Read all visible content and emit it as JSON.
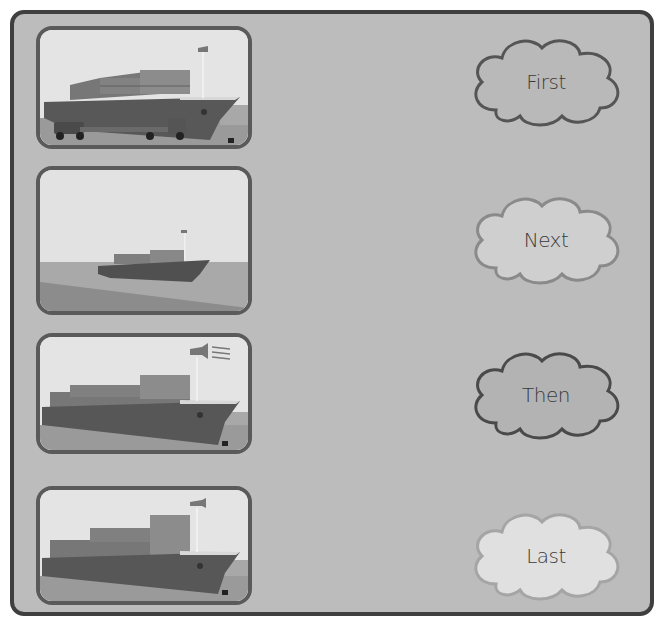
{
  "worksheet": {
    "title": "Sequencing: Cargo Ship",
    "panels": [
      {
        "id": 1,
        "scene": "ship-docked-loading-truck",
        "description": "Container ship docked with truck loading cargo"
      },
      {
        "id": 2,
        "scene": "ship-at-sea-far",
        "description": "Container ship sailing at sea in the distance"
      },
      {
        "id": 3,
        "scene": "ship-horn-sounding",
        "description": "Container ship arriving with horn sounding"
      },
      {
        "id": 4,
        "scene": "ship-docked",
        "description": "Container ship docked at port"
      }
    ],
    "clouds": [
      {
        "label": "First",
        "fill": "#b9b9b9",
        "stroke": "#555555"
      },
      {
        "label": "Next",
        "fill": "#cfcfcf",
        "stroke": "#8a8a8a"
      },
      {
        "label": "Then",
        "fill": "#b3b3b3",
        "stroke": "#4a4a4a"
      },
      {
        "label": "Last",
        "fill": "#e0e0e0",
        "stroke": "#a5a5a5"
      }
    ]
  },
  "colors": {
    "frame_bg": "#bcbcbc",
    "frame_border": "#3f3f3f",
    "panel_border": "#5a5a5a"
  }
}
